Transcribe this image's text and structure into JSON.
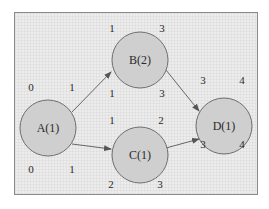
{
  "diagram": {
    "type": "activity-network",
    "nodes": [
      {
        "id": "A",
        "label": "A(1)",
        "cx": 48,
        "cy": 128,
        "r": 28,
        "es": "0",
        "ef": "1",
        "ls": "0",
        "lf": "1"
      },
      {
        "id": "B",
        "label": "B(2)",
        "cx": 140,
        "cy": 60,
        "r": 28,
        "es": "1",
        "ef": "3",
        "ls": "1",
        "lf": "3"
      },
      {
        "id": "C",
        "label": "C(1)",
        "cx": 140,
        "cy": 155,
        "r": 28,
        "es": "1",
        "ef": "2",
        "ls": "2",
        "lf": "3"
      },
      {
        "id": "D",
        "label": "D(1)",
        "cx": 224,
        "cy": 126,
        "r": 28,
        "es": "3",
        "ef": "4",
        "ls": "3",
        "lf": "4"
      }
    ],
    "edges": [
      {
        "from": "A",
        "to": "B"
      },
      {
        "from": "A",
        "to": "C"
      },
      {
        "from": "B",
        "to": "D"
      },
      {
        "from": "C",
        "to": "D"
      }
    ],
    "colors": {
      "node_fill": "#cfcfcf",
      "node_stroke": "#6e6e6e",
      "background": "#ececec",
      "border": "#8a8a8a"
    }
  }
}
